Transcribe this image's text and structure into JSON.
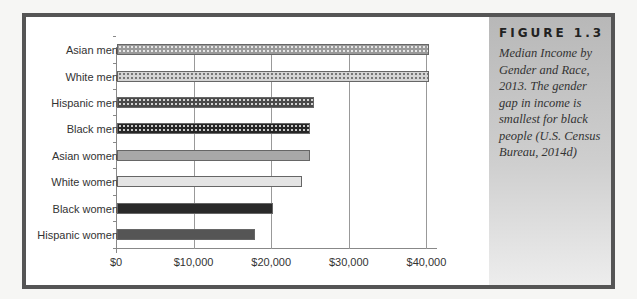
{
  "figure": {
    "label": "FIGURE 1.3",
    "caption": "Median Income by Gender and Race, 2013. The gender gap in income is smallest for black people (U.S. Census Bureau, 2014d)"
  },
  "chart_data": {
    "type": "bar",
    "orientation": "horizontal",
    "title": "Median Income by Gender and Race, 2013",
    "xlabel": "",
    "ylabel": "",
    "categories": [
      "Asian men",
      "White men",
      "Hispanic men",
      "Black men",
      "Asian women",
      "White women",
      "Black women",
      "Hispanic women"
    ],
    "values": [
      40200,
      40200,
      25400,
      24900,
      24900,
      23900,
      20100,
      17800
    ],
    "xlim": [
      0,
      45000
    ],
    "x_ticks": [
      "$0",
      "$10,000",
      "$20,000",
      "$30,000",
      "$40,000"
    ],
    "x_tick_values": [
      0,
      10000,
      20000,
      30000,
      40000
    ],
    "grid": "vertical",
    "legend": "none",
    "bar_colors": [
      "#9a9a9a",
      "#d4d4d4",
      "#4a4a4a",
      "#262626",
      "#a8a8a8",
      "#e4e4e4",
      "#2a2a2a",
      "#555555"
    ],
    "bar_patterns": [
      "dotted",
      "dotted",
      "dotted",
      "dotted",
      "solid",
      "solid",
      "solid",
      "solid"
    ]
  }
}
